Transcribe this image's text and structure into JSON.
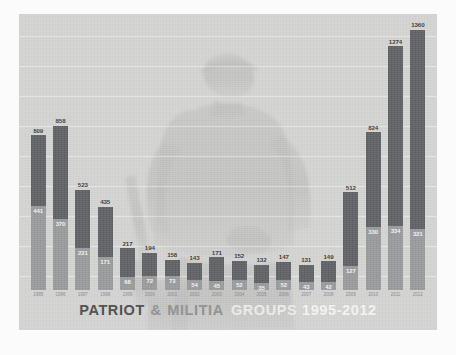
{
  "poster": {
    "title_parts": {
      "patriot": "PATRIOT",
      "amp": "&",
      "militia": "MILITIA",
      "groups": "GROUPS",
      "years": "1995-2012"
    },
    "title_full": "PATRIOT & MILITIA GROUPS 1995-2012",
    "background_image_name": "armed-militia-figure-watermark"
  },
  "colors": {
    "plate_background": "#d3d3d1",
    "bar_total": "#5f6063",
    "bar_militia": "#97999b",
    "total_label": "#3a3b3d",
    "sub_label": "#f2f2f0",
    "year_label": "#86888a",
    "gridline": "#ffffff"
  },
  "chart_data": {
    "type": "bar",
    "title": "PATRIOT & MILITIA GROUPS 1995-2012",
    "xlabel": "",
    "ylabel": "",
    "ylim": [
      0,
      1400
    ],
    "grid": true,
    "legend_position": "none",
    "stacked": true,
    "categories": [
      "1995",
      "1996",
      "1997",
      "1998",
      "1999",
      "2000",
      "2001",
      "2002",
      "2003",
      "2004",
      "2005",
      "2006",
      "2007",
      "2008",
      "2009",
      "2010",
      "2011",
      "2012"
    ],
    "series": [
      {
        "name": "Patriot groups (total)",
        "values": [
          809,
          858,
          523,
          435,
          217,
          194,
          158,
          143,
          171,
          152,
          132,
          147,
          131,
          149,
          512,
          824,
          1274,
          1360
        ]
      },
      {
        "name": "Militia groups",
        "values": [
          441,
          370,
          221,
          171,
          68,
          72,
          73,
          54,
          45,
          52,
          35,
          52,
          43,
          42,
          127,
          330,
          334,
          321
        ]
      }
    ]
  }
}
